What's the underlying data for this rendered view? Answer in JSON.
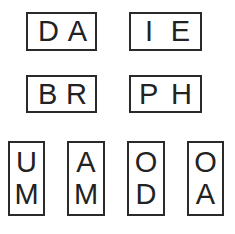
{
  "diagram": {
    "horizontal_pairs": [
      {
        "letters": [
          "D",
          "A"
        ]
      },
      {
        "letters": [
          "I",
          "E"
        ]
      },
      {
        "letters": [
          "B",
          "R"
        ]
      },
      {
        "letters": [
          "P",
          "H"
        ]
      }
    ],
    "vertical_pairs": [
      {
        "letters": [
          "U",
          "M"
        ]
      },
      {
        "letters": [
          "A",
          "M"
        ]
      },
      {
        "letters": [
          "O",
          "D"
        ]
      },
      {
        "letters": [
          "O",
          "A"
        ]
      }
    ]
  }
}
